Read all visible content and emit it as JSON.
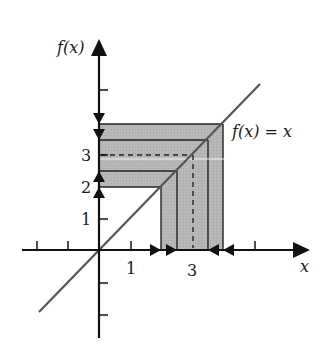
{
  "figure": {
    "y_axis_label": "f(x)",
    "x_axis_label": "x",
    "line_label": "f(x) = x",
    "x_tick_labels": [
      {
        "value": 1,
        "text": "1"
      },
      {
        "value": 3,
        "text": "3"
      }
    ],
    "y_tick_labels": [
      {
        "value": 1,
        "text": "1"
      },
      {
        "value": 2,
        "text": "2"
      },
      {
        "value": 3,
        "text": "3"
      }
    ],
    "x_ticks": [
      -2,
      -1,
      1,
      2,
      3,
      4,
      5
    ],
    "y_ticks": [
      -2,
      -1,
      1,
      2,
      3,
      4,
      5
    ],
    "fixed_point": 3,
    "nested_intervals": [
      [
        2,
        4
      ],
      [
        2.5,
        3.5
      ]
    ],
    "colors": {
      "axis": "#111111",
      "shade": "#b4b4b4",
      "line": "#555555"
    }
  }
}
